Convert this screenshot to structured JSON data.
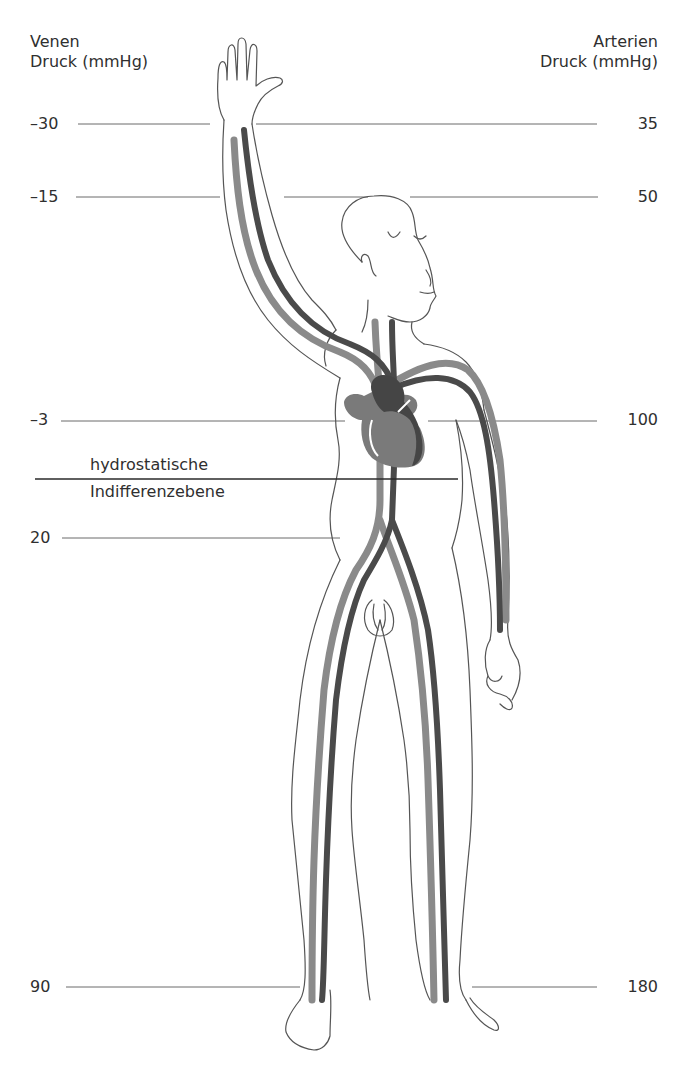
{
  "headers": {
    "left": {
      "line1": "Venen",
      "line2": "Druck (mmHg)"
    },
    "right": {
      "line1": "Arterien",
      "line2": "Druck (mmHg)"
    }
  },
  "levels": [
    {
      "id": "hand",
      "venous": "–30",
      "arterial": "35"
    },
    {
      "id": "forearm",
      "venous": "–15",
      "arterial": "50"
    },
    {
      "id": "heart",
      "venous": "–3",
      "arterial": "100"
    },
    {
      "id": "pelvis",
      "venous": "20",
      "arterial": null
    },
    {
      "id": "foot",
      "venous": "90",
      "arterial": "180"
    }
  ],
  "plane": {
    "line1": "hydrostatische",
    "line2": "Indifferenzebene"
  },
  "colors": {
    "vein": "#8a8a8a",
    "artery": "#4a4a4a",
    "outline": "#555555",
    "guide": "#6a6a6a",
    "heart_left": "#7a7a7a",
    "heart_right": "#454545"
  },
  "illustration": {
    "subject": "standing human figure with raised right arm",
    "vessels": [
      "vein",
      "artery"
    ],
    "icon": "heart-icon"
  }
}
